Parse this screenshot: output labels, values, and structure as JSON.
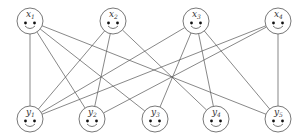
{
  "diagram": {
    "type": "bipartite-graph",
    "colors": {
      "stroke": "#555555",
      "background": "#ffffff",
      "eye": "#111111"
    },
    "top_nodes": [
      {
        "id": "x1",
        "base": "x",
        "sub": "1",
        "cx": 30,
        "cy": 21
      },
      {
        "id": "x2",
        "base": "x",
        "sub": "2",
        "cx": 113,
        "cy": 21
      },
      {
        "id": "x3",
        "base": "x",
        "sub": "3",
        "cx": 196,
        "cy": 21
      },
      {
        "id": "x4",
        "base": "x",
        "sub": "4",
        "cx": 278,
        "cy": 21
      }
    ],
    "bottom_nodes": [
      {
        "id": "y1",
        "base": "y",
        "sub": "1",
        "cx": 30,
        "cy": 119
      },
      {
        "id": "y2",
        "base": "y",
        "sub": "2",
        "cx": 92,
        "cy": 119
      },
      {
        "id": "y3",
        "base": "y",
        "sub": "3",
        "cx": 155,
        "cy": 119
      },
      {
        "id": "y4",
        "base": "y",
        "sub": "4",
        "cx": 216,
        "cy": 119
      },
      {
        "id": "y5",
        "base": "y",
        "sub": "5",
        "cx": 278,
        "cy": 119
      }
    ],
    "edges": [
      [
        "x1",
        "y1"
      ],
      [
        "x1",
        "y2"
      ],
      [
        "x1",
        "y3"
      ],
      [
        "x1",
        "y5"
      ],
      [
        "x2",
        "y1"
      ],
      [
        "x2",
        "y2"
      ],
      [
        "x2",
        "y4"
      ],
      [
        "x3",
        "y1"
      ],
      [
        "x3",
        "y3"
      ],
      [
        "x3",
        "y4"
      ],
      [
        "x3",
        "y5"
      ],
      [
        "x4",
        "y1"
      ],
      [
        "x4",
        "y2"
      ],
      [
        "x4",
        "y5"
      ]
    ],
    "node_icon": "smiley-face-icon",
    "radius": 13
  }
}
